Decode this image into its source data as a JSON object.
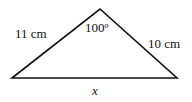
{
  "diagram": {
    "type": "triangle",
    "vertices": {
      "left": [
        12,
        78
      ],
      "apex": [
        100,
        9
      ],
      "right": [
        177,
        78
      ]
    },
    "labels": {
      "left_side": "11 cm",
      "right_side": "10 cm",
      "apex_angle": "100º",
      "base": "x"
    },
    "stroke_color": "#111111"
  }
}
